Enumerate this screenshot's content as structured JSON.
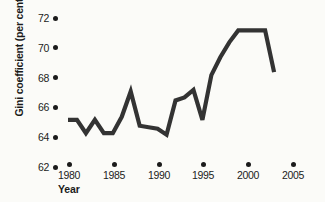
{
  "chart_data": {
    "type": "line",
    "title": "",
    "xlabel": "Year",
    "ylabel": "Gini coefficient (per cent)",
    "xlim": [
      1978,
      2006
    ],
    "ylim": [
      62,
      72
    ],
    "grid": false,
    "legend": "none",
    "line_color": "#333333",
    "text_color": "#1b1b1b",
    "background_color": "#fbfbf8",
    "x_ticks": [
      "1980",
      "1985",
      "1990",
      "1995",
      "2000",
      "2005"
    ],
    "y_ticks": [
      "62",
      "64",
      "66",
      "68",
      "70",
      "72"
    ],
    "x": [
      1980,
      1981,
      1982,
      1983,
      1984,
      1985,
      1986,
      1987,
      1988,
      1989,
      1990,
      1991,
      1992,
      1993,
      1994,
      1995,
      1996,
      1997,
      1998,
      1999,
      2000,
      2001,
      2002,
      2003
    ],
    "values": [
      65.0,
      65.0,
      64.1,
      65.0,
      64.1,
      64.1,
      65.2,
      66.9,
      64.6,
      64.5,
      64.4,
      64.0,
      66.3,
      66.5,
      67.0,
      65.0,
      68.0,
      69.2,
      70.2,
      71.0,
      71.0,
      71.0,
      71.0,
      68.2
    ]
  }
}
